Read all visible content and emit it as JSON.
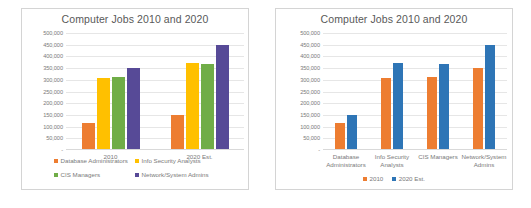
{
  "chart_data": [
    {
      "id": "left",
      "type": "bar",
      "title": "Computer Jobs 2010 and 2020",
      "xlabel": "",
      "ylabel": "",
      "ylim": [
        0,
        500000
      ],
      "ytick_step": 50000,
      "grid": true,
      "legend_position": "bottom",
      "categories": [
        "2010",
        "2020 Est."
      ],
      "ytick_labels": [
        "500,000",
        "450,000",
        "400,000",
        "350,000",
        "300,000",
        "250,000",
        "200,000",
        "150,000",
        "100,000",
        "50,000",
        "-"
      ],
      "series": [
        {
          "name": "Database Administrators",
          "color": "#ED7D31",
          "values": [
            110000,
            144000
          ]
        },
        {
          "name": "Info Security Analysts",
          "color": "#FFC000",
          "values": [
            302000,
            367000
          ]
        },
        {
          "name": "CIS Managers",
          "color": "#70AD47",
          "values": [
            307000,
            363000
          ]
        },
        {
          "name": "Network/System Admins",
          "color": "#574A97",
          "values": [
            347000,
            443000
          ]
        }
      ]
    },
    {
      "id": "right",
      "type": "bar",
      "title": "Computer Jobs 2010 and 2020",
      "xlabel": "",
      "ylabel": "",
      "ylim": [
        0,
        500000
      ],
      "ytick_step": 50000,
      "grid": true,
      "legend_position": "bottom",
      "categories": [
        "Database Administrators",
        "Info Security Analysts",
        "CIS Managers",
        "Network/System Admins"
      ],
      "ytick_labels": [
        "500,000",
        "450,000",
        "400,000",
        "350,000",
        "300,000",
        "250,000",
        "200,000",
        "150,000",
        "100,000",
        "50,000",
        "-"
      ],
      "series": [
        {
          "name": "2010",
          "color": "#ED7D31",
          "values": [
            110000,
            302000,
            307000,
            347000
          ]
        },
        {
          "name": "2020 Est.",
          "color": "#2E75B6",
          "values": [
            144000,
            367000,
            363000,
            443000
          ]
        }
      ]
    }
  ]
}
